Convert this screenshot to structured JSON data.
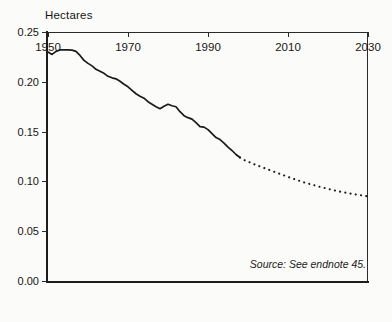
{
  "figure": {
    "source_note": "Source: See endnote 45.",
    "ylabel": "Hectares"
  },
  "chart_data": {
    "type": "line",
    "title": "",
    "subtitle": "",
    "xlabel": "",
    "ylabel": "Hectares",
    "xlim": [
      1950,
      2030
    ],
    "ylim": [
      0.0,
      0.25
    ],
    "grid": false,
    "legend": null,
    "xticks": [
      1950,
      1970,
      1990,
      2010,
      2030
    ],
    "xticklabels": [
      "1950",
      "1970",
      "1990",
      "2010",
      "2030"
    ],
    "yticks": [
      0.0,
      0.05,
      0.1,
      0.15,
      0.2,
      0.25
    ],
    "yticklabels": [
      "0.00",
      "0.05",
      "0.10",
      "0.15",
      "0.20",
      "0.25"
    ],
    "annotations": [
      {
        "text": "Source: See endnote 45.",
        "x": 2016,
        "y": 0.023,
        "style": "italic"
      }
    ],
    "series": [
      {
        "name": "Grainland per person (historical)",
        "style": "solid",
        "color": "#1a1a1a",
        "x": [
          1950,
          1951,
          1952,
          1953,
          1954,
          1955,
          1956,
          1957,
          1958,
          1959,
          1960,
          1961,
          1962,
          1963,
          1964,
          1965,
          1966,
          1967,
          1968,
          1969,
          1970,
          1971,
          1972,
          1973,
          1974,
          1975,
          1976,
          1977,
          1978,
          1979,
          1980,
          1981,
          1982,
          1983,
          1984,
          1985,
          1986,
          1987,
          1988,
          1989,
          1990,
          1991,
          1992,
          1993,
          1994,
          1995,
          1996,
          1997,
          1998
        ],
        "y": [
          0.23,
          0.2275,
          0.2305,
          0.232,
          0.2322,
          0.232,
          0.2318,
          0.2305,
          0.2265,
          0.2215,
          0.2185,
          0.216,
          0.2125,
          0.2105,
          0.2085,
          0.2055,
          0.204,
          0.203,
          0.2005,
          0.1975,
          0.195,
          0.1915,
          0.188,
          0.1855,
          0.1835,
          0.18,
          0.1775,
          0.175,
          0.173,
          0.1755,
          0.1775,
          0.176,
          0.175,
          0.17,
          0.166,
          0.164,
          0.1625,
          0.159,
          0.155,
          0.1545,
          0.152,
          0.148,
          0.144,
          0.142,
          0.1385,
          0.1345,
          0.131,
          0.127,
          0.124
        ]
      },
      {
        "name": "Grainland per person (projected)",
        "style": "dotted",
        "color": "#1a1a1a",
        "x": [
          1998,
          1999,
          2002,
          2006,
          2010,
          2014,
          2018,
          2022,
          2026,
          2030
        ],
        "y": [
          0.124,
          0.1215,
          0.1165,
          0.1105,
          0.1045,
          0.099,
          0.0945,
          0.0905,
          0.0875,
          0.085
        ]
      }
    ]
  }
}
